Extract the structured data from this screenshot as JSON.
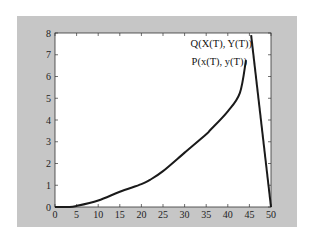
{
  "chart_data": {
    "type": "line",
    "title": "",
    "xlabel": "",
    "ylabel": "",
    "xlim": [
      0,
      50
    ],
    "ylim": [
      0,
      8
    ],
    "grid": false,
    "legend": null,
    "x_ticks": [
      0,
      5,
      10,
      15,
      20,
      25,
      30,
      35,
      40,
      45,
      50
    ],
    "y_ticks": [
      0,
      1,
      2,
      3,
      4,
      5,
      6,
      7,
      8
    ],
    "series": [
      {
        "name": "P(x(T), y(T))",
        "x": [
          0,
          3,
          5,
          10,
          15,
          20,
          22,
          25,
          30,
          35,
          36,
          40,
          42.8,
          44.2
        ],
        "y": [
          0,
          0,
          0.05,
          0.3,
          0.7,
          1.05,
          1.25,
          1.65,
          2.5,
          3.35,
          3.55,
          4.4,
          5.25,
          6.75
        ]
      },
      {
        "name": "Q(X(T), Y(T))",
        "x": [
          45.4,
          50
        ],
        "y": [
          7.9,
          0
        ]
      }
    ],
    "annotations": [
      {
        "text": "Q(X(T), Y(T))",
        "x": 45.4,
        "y": 7.6
      },
      {
        "text": "P(x(T), y(T))",
        "x": 44.2,
        "y": 6.8
      }
    ]
  },
  "colors": {
    "frame": "#c6c6c6",
    "plot_bg": "#ffffff",
    "line": "#1a1a1a"
  }
}
